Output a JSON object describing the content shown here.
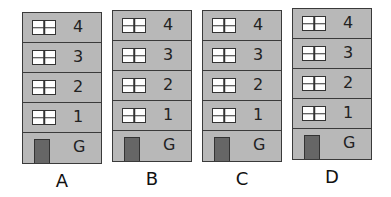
{
  "buildings": [
    {
      "label": "A",
      "floors": [
        "4",
        "3",
        "2",
        "1",
        "G"
      ]
    },
    {
      "label": "B",
      "floors": [
        "4",
        "3",
        "2",
        "1",
        "G"
      ]
    },
    {
      "label": "C",
      "floors": [
        "4",
        "3",
        "2",
        "1",
        "G"
      ]
    },
    {
      "label": "D",
      "floors": [
        "4",
        "3",
        "2",
        "1",
        "G"
      ]
    }
  ],
  "colors": {
    "wall": "#b8b8b8",
    "door": "#666666",
    "outline": "#3a3a3a",
    "window": "#ffffff"
  }
}
